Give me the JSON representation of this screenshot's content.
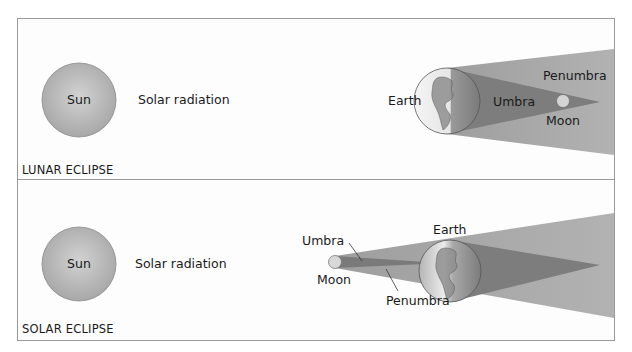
{
  "colors": {
    "background": "#ffffff",
    "panel_border": "#9a9a9a",
    "sun_fill": "#bdbdbd",
    "penumbra": "#a9a9a9",
    "umbra": "#7d7d7d",
    "text": "#1a1a1a"
  },
  "panels": {
    "lunar": {
      "caption": "LUNAR ECLIPSE",
      "sun_label": "Sun",
      "radiation_label": "Solar radiation",
      "earth_label": "Earth",
      "umbra_label": "Umbra",
      "penumbra_label": "Penumbra",
      "moon_label": "Moon"
    },
    "solar": {
      "caption": "SOLAR ECLIPSE",
      "sun_label": "Sun",
      "radiation_label": "Solar radiation",
      "earth_label": "Earth",
      "umbra_label": "Umbra",
      "penumbra_label": "Penumbra",
      "moon_label": "Moon"
    }
  }
}
